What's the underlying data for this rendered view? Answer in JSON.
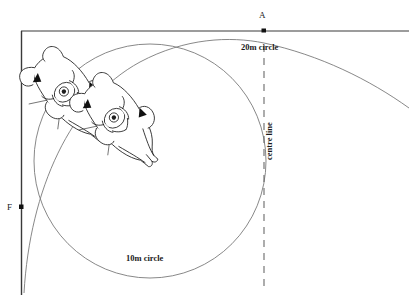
{
  "diagram": {
    "background_color": "#ffffff",
    "line_color": "#2b2b2b",
    "arc_color": "#6b6b6b",
    "labels": {
      "point_a": "A",
      "point_f": "F",
      "circle_20m": "20m circle",
      "circle_10m": "10m circle",
      "centre_line": "centre line"
    },
    "markers": [
      {
        "name": "A",
        "x": 264,
        "y": 31
      },
      {
        "name": "F",
        "x": 21,
        "y": 207
      }
    ],
    "geometry": {
      "arena_top_line": {
        "x1": 21,
        "y1": 31,
        "x2": 409,
        "y2": 31
      },
      "arena_left_line": {
        "x1": 21,
        "y1": 31,
        "x2": 21,
        "y2": 295
      },
      "centre_line": {
        "x": 264,
        "y1": 45,
        "y2": 292,
        "style": "dashed"
      },
      "circle_10m": {
        "cx": 150,
        "cy": 161,
        "r": 116
      },
      "circle_20m": {
        "cx": 256,
        "cy": 276,
        "r": 232
      }
    },
    "figures": [
      {
        "name": "horse-and-rider-1",
        "cx": 62,
        "cy": 97,
        "rotation": -40
      },
      {
        "name": "horse-and-rider-2",
        "cx": 112,
        "cy": 123,
        "rotation": -40
      }
    ]
  }
}
